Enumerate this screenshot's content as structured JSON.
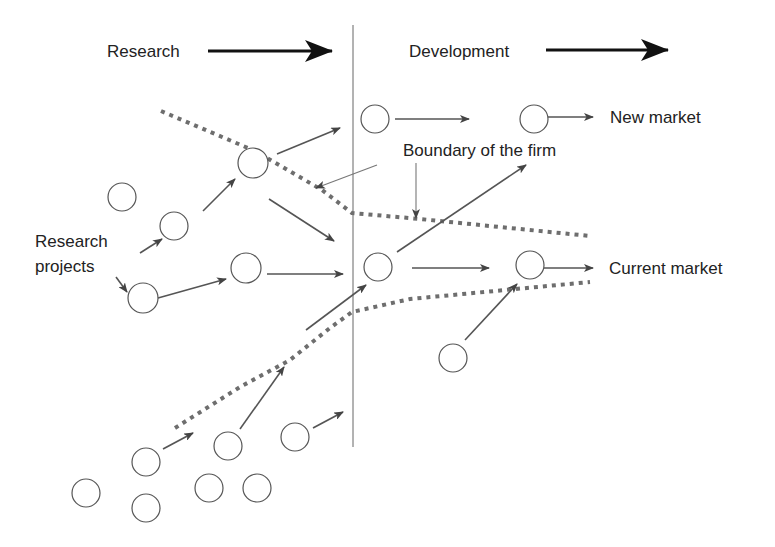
{
  "diagram": {
    "phases": [
      {
        "id": "research",
        "label": "Research"
      },
      {
        "id": "development",
        "label": "Development"
      }
    ],
    "labels": {
      "research_projects_line1": "Research",
      "research_projects_line2": "projects",
      "boundary": "Boundary of the firm",
      "new_market": "New market",
      "current_market": "Current market"
    },
    "colors": {
      "node_stroke": "#555555",
      "arrow": "#555555",
      "boundary": "#6e6e6e",
      "phase_arrow": "#111111",
      "text": "#222222"
    }
  }
}
